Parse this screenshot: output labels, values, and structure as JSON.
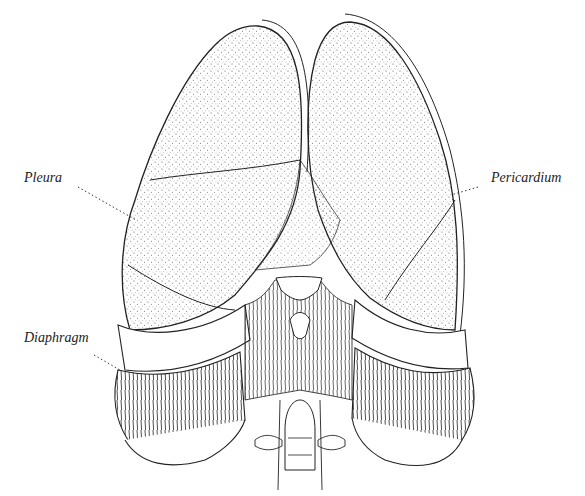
{
  "figure": {
    "labels": [
      {
        "id": "pleura",
        "text": "Pleura",
        "x": 24,
        "y": 176
      },
      {
        "id": "pericardium",
        "text": "Pericardium",
        "x": 491,
        "y": 176
      },
      {
        "id": "diaphragm",
        "text": "Diaphragm",
        "x": 24,
        "y": 334
      }
    ],
    "colors": {
      "line": "#222222",
      "stipple": "#555555",
      "background": "#ffffff"
    }
  }
}
